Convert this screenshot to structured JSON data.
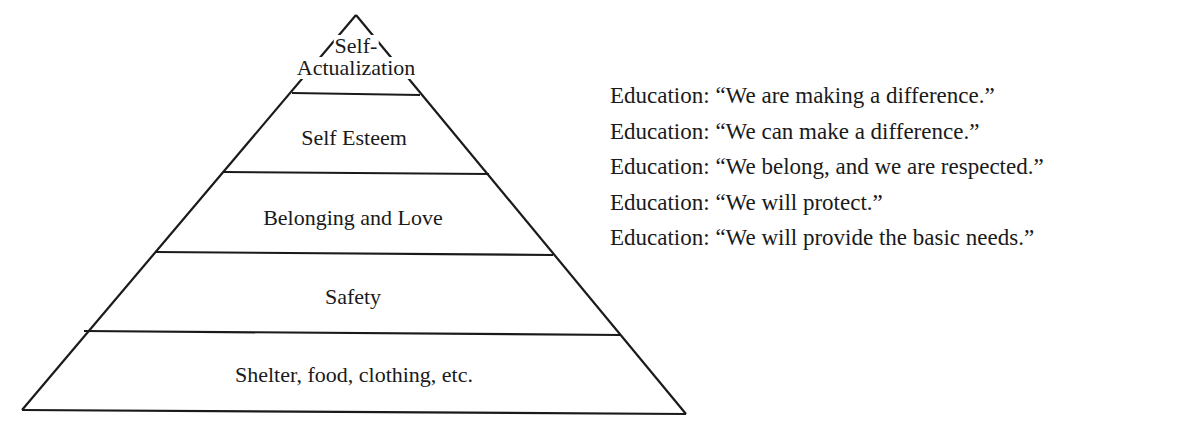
{
  "diagram": {
    "type": "pyramid",
    "levels": [
      {
        "label_line1": "Self-",
        "label_line2": "Actualization"
      },
      {
        "label": "Self Esteem"
      },
      {
        "label": "Belonging and Love"
      },
      {
        "label": "Safety"
      },
      {
        "label": "Shelter, food, clothing, etc."
      }
    ],
    "statements": [
      "Education: “We are making a difference.”",
      "Education: “We can make a difference.”",
      "Education: “We belong, and we are respected.”",
      "Education: “We will protect.”",
      "Education: “We will provide the basic needs.”"
    ],
    "colors": {
      "line": "#1a1a1a",
      "text": "#1a1a1a",
      "background": "#ffffff"
    }
  }
}
